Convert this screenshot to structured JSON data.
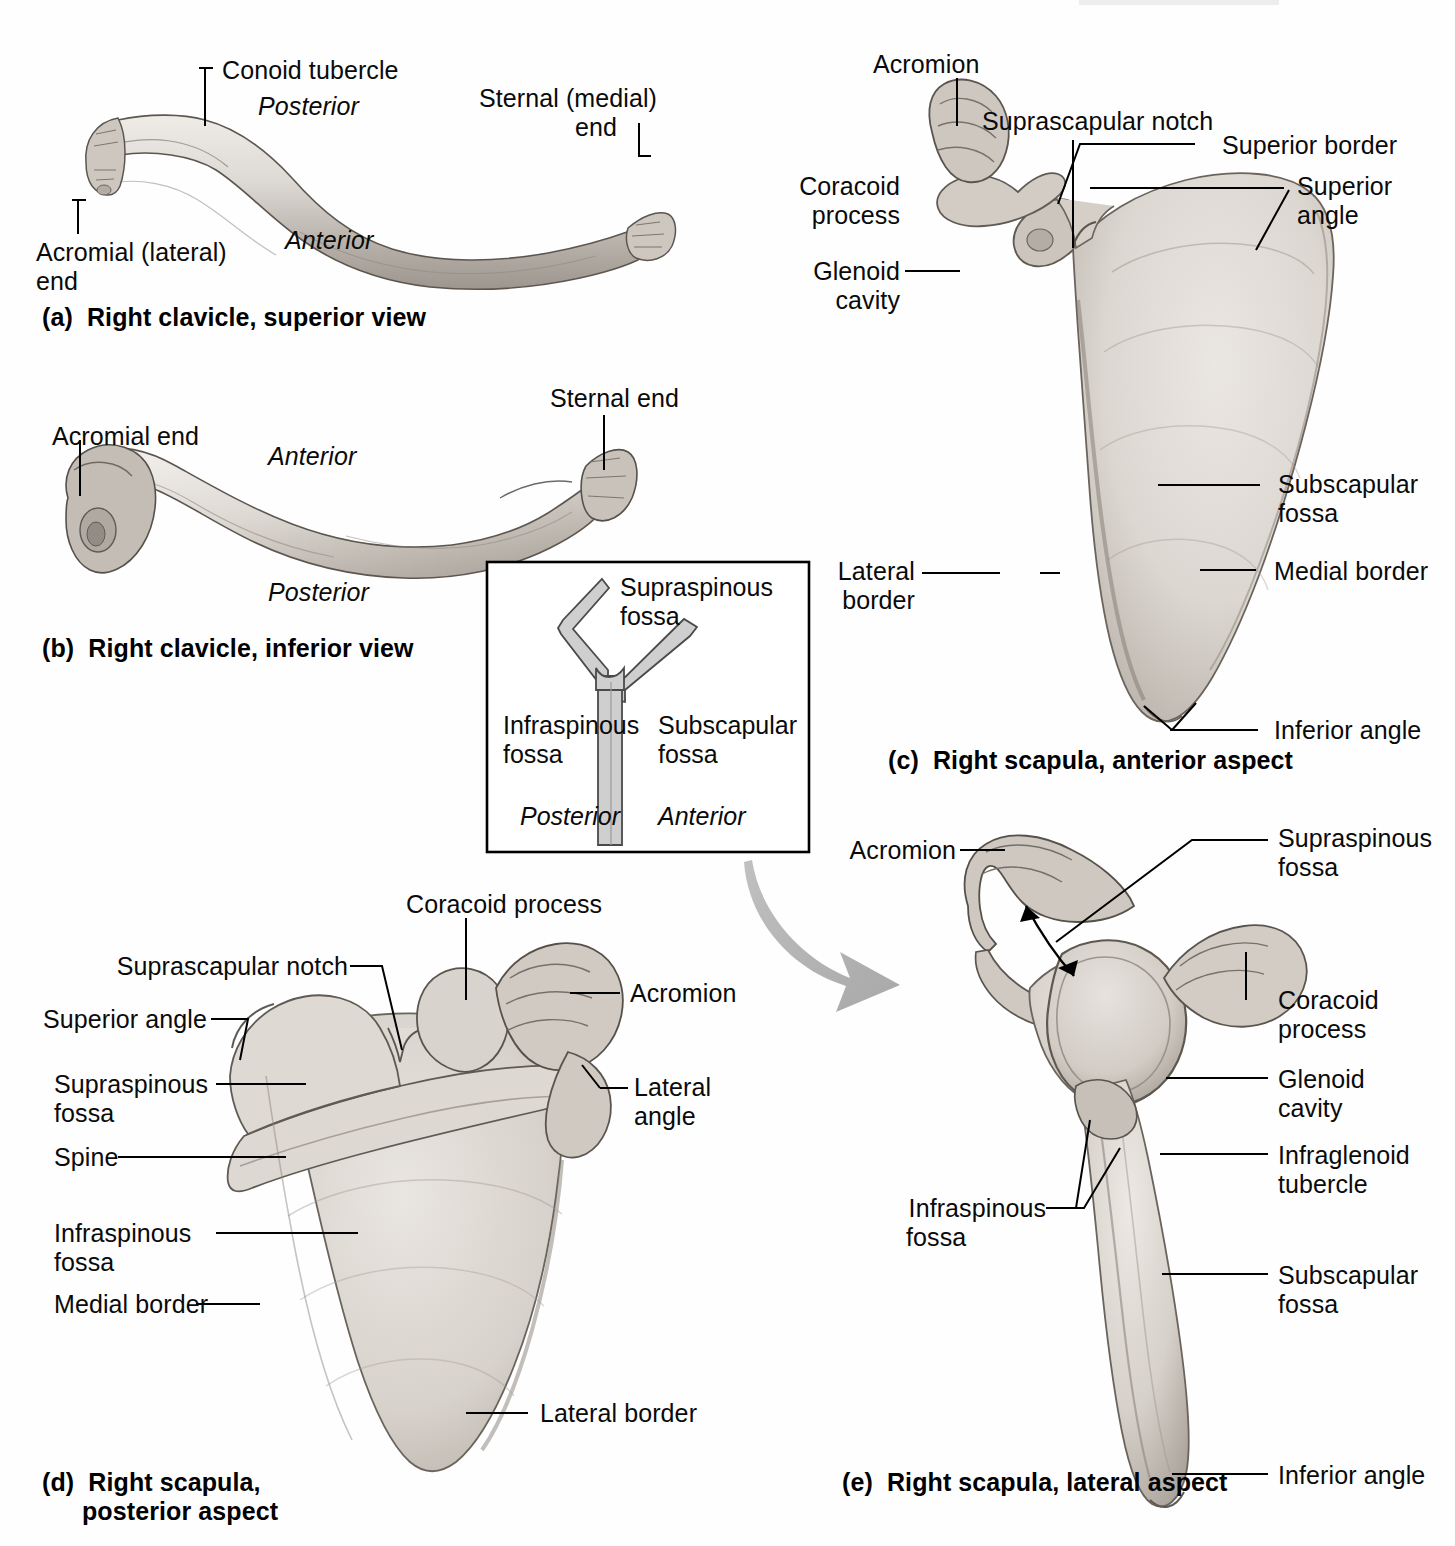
{
  "figure": {
    "ink_color": "#0a0a0a",
    "bone_fill": "#d8d4cf",
    "inset_stroke": "#000000",
    "inset_bone_fill": "#c9c9c9",
    "arrow_color": "#b5b5b5"
  },
  "panels": {
    "a": {
      "caption": "(a)  Right clavicle, superior view",
      "labels": [
        {
          "key": "conoid_tubercle",
          "text": "Conoid tubercle"
        },
        {
          "key": "posterior",
          "text": "Posterior",
          "style": "italic"
        },
        {
          "key": "sternal_medial_end",
          "text": "Sternal (medial)\nend"
        },
        {
          "key": "anterior",
          "text": "Anterior",
          "style": "italic"
        },
        {
          "key": "acromial_lateral_end",
          "text": "Acromial (lateral)\nend"
        }
      ]
    },
    "b": {
      "caption": "(b)  Right clavicle, inferior view",
      "labels": [
        {
          "key": "acromial_end",
          "text": "Acromial end"
        },
        {
          "key": "sternal_end",
          "text": "Sternal end"
        },
        {
          "key": "anterior",
          "text": "Anterior",
          "style": "italic"
        },
        {
          "key": "posterior",
          "text": "Posterior",
          "style": "italic"
        }
      ]
    },
    "c": {
      "caption": "(c)  Right scapula, anterior aspect",
      "labels": [
        {
          "key": "acromion",
          "text": "Acromion"
        },
        {
          "key": "suprascapular_notch",
          "text": "Suprascapular notch"
        },
        {
          "key": "superior_border",
          "text": "Superior border"
        },
        {
          "key": "superior_angle",
          "text": "Superior\nangle"
        },
        {
          "key": "coracoid_process",
          "text": "Coracoid\nprocess"
        },
        {
          "key": "glenoid_cavity",
          "text": "Glenoid\ncavity"
        },
        {
          "key": "subscapular_fossa",
          "text": "Subscapular\nfossa"
        },
        {
          "key": "lateral_border",
          "text": "Lateral\nborder"
        },
        {
          "key": "medial_border",
          "text": "Medial border"
        },
        {
          "key": "inferior_angle",
          "text": "Inferior angle"
        }
      ]
    },
    "d": {
      "caption": "(d)  Right scapula,\n      posterior aspect",
      "labels": [
        {
          "key": "coracoid_process",
          "text": "Coracoid process"
        },
        {
          "key": "suprascapular_notch",
          "text": "Suprascapular notch"
        },
        {
          "key": "acromion",
          "text": "Acromion"
        },
        {
          "key": "superior_angle",
          "text": "Superior angle"
        },
        {
          "key": "supraspinous_fossa",
          "text": "Supraspinous\nfossa"
        },
        {
          "key": "lateral_angle",
          "text": "Lateral\nangle"
        },
        {
          "key": "spine",
          "text": "Spine"
        },
        {
          "key": "infraspinous_fossa",
          "text": "Infraspinous\nfossa"
        },
        {
          "key": "medial_border",
          "text": "Medial border"
        },
        {
          "key": "lateral_border",
          "text": "Lateral border"
        }
      ]
    },
    "e": {
      "caption": "(e)  Right scapula, lateral aspect",
      "labels": [
        {
          "key": "acromion",
          "text": "Acromion"
        },
        {
          "key": "supraspinous_fossa",
          "text": "Supraspinous\nfossa"
        },
        {
          "key": "coracoid_process",
          "text": "Coracoid\nprocess"
        },
        {
          "key": "glenoid_cavity",
          "text": "Glenoid\ncavity"
        },
        {
          "key": "infraglenoid_tubercle",
          "text": "Infraglenoid\ntubercle"
        },
        {
          "key": "infraspinous_fossa",
          "text": "Infraspinous\nfossa"
        },
        {
          "key": "subscapular_fossa",
          "text": "Subscapular\nfossa"
        },
        {
          "key": "inferior_angle",
          "text": "Inferior angle"
        }
      ]
    }
  },
  "inset": {
    "name": "scapula-cross-section-orientation-key",
    "labels": [
      {
        "key": "supraspinous_fossa",
        "text": "Supraspinous\nfossa"
      },
      {
        "key": "infraspinous_fossa",
        "text": "Infraspinous\nfossa"
      },
      {
        "key": "subscapular_fossa",
        "text": "Subscapular\nfossa"
      },
      {
        "key": "posterior",
        "text": "Posterior",
        "style": "italic"
      },
      {
        "key": "anterior",
        "text": "Anterior",
        "style": "italic"
      }
    ]
  },
  "text": {
    "a_conoid_tubercle": "Conoid tubercle",
    "a_posterior": "Posterior",
    "a_sternal_end_l1": "Sternal (medial)",
    "a_sternal_end_l2": "end",
    "a_anterior": "Anterior",
    "a_acromial_end_l1": "Acromial (lateral)",
    "a_acromial_end_l2": "end",
    "a_caption": "(a)  Right clavicle, superior view",
    "b_acromial_end": "Acromial end",
    "b_sternal_end": "Sternal end",
    "b_anterior": "Anterior",
    "b_posterior": "Posterior",
    "b_caption": "(b)  Right clavicle, inferior view",
    "inset_supraspinous_l1": "Supraspinous",
    "inset_supraspinous_l2": "fossa",
    "inset_infraspinous_l1": "Infraspinous",
    "inset_infraspinous_l2": "fossa",
    "inset_subscapular_l1": "Subscapular",
    "inset_subscapular_l2": "fossa",
    "inset_posterior": "Posterior",
    "inset_anterior": "Anterior",
    "c_acromion": "Acromion",
    "c_suprascapular_notch": "Suprascapular notch",
    "c_superior_border": "Superior border",
    "c_superior_angle_l1": "Superior",
    "c_superior_angle_l2": "angle",
    "c_coracoid_l1": "Coracoid",
    "c_coracoid_l2": "process",
    "c_glenoid_l1": "Glenoid",
    "c_glenoid_l2": "cavity",
    "c_subscapular_l1": "Subscapular",
    "c_subscapular_l2": "fossa",
    "c_lateral_border_l1": "Lateral",
    "c_lateral_border_l2": "border",
    "c_medial_border": "Medial border",
    "c_inferior_angle": "Inferior angle",
    "c_caption": "(c)  Right scapula, anterior aspect",
    "d_coracoid_process": "Coracoid process",
    "d_suprascapular_notch": "Suprascapular notch",
    "d_acromion": "Acromion",
    "d_superior_angle": "Superior angle",
    "d_supraspinous_l1": "Supraspinous",
    "d_supraspinous_l2": "fossa",
    "d_lateral_angle_l1": "Lateral",
    "d_lateral_angle_l2": "angle",
    "d_spine": "Spine",
    "d_infraspinous_l1": "Infraspinous",
    "d_infraspinous_l2": "fossa",
    "d_medial_border": "Medial border",
    "d_lateral_border": "Lateral border",
    "d_caption_l1": "(d)  Right scapula,",
    "d_caption_l2": "posterior aspect",
    "e_acromion": "Acromion",
    "e_supraspinous_l1": "Supraspinous",
    "e_supraspinous_l2": "fossa",
    "e_coracoid_l1": "Coracoid",
    "e_coracoid_l2": "process",
    "e_glenoid_l1": "Glenoid",
    "e_glenoid_l2": "cavity",
    "e_infraglenoid_l1": "Infraglenoid",
    "e_infraglenoid_l2": "tubercle",
    "e_infraspinous_l1": "Infraspinous",
    "e_infraspinous_l2": "fossa",
    "e_subscapular_l1": "Subscapular",
    "e_subscapular_l2": "fossa",
    "e_inferior_angle": "Inferior angle",
    "e_caption": "(e)  Right scapula, lateral aspect"
  }
}
